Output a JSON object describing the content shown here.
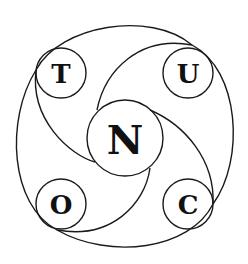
{
  "diagram": {
    "title": "",
    "nodes": [
      {
        "id": "center",
        "label": "N",
        "cx": 125,
        "cy": 138,
        "r": 38,
        "font_size": 40
      },
      {
        "id": "top-left",
        "label": "T",
        "cx": 61,
        "cy": 73,
        "r": 25,
        "font_size": 26
      },
      {
        "id": "top-right",
        "label": "U",
        "cx": 188,
        "cy": 73,
        "r": 25,
        "font_size": 26
      },
      {
        "id": "bottom-left",
        "label": "O",
        "cx": 61,
        "cy": 204,
        "r": 25,
        "font_size": 26
      },
      {
        "id": "bottom-right",
        "label": "C",
        "cx": 188,
        "cy": 204,
        "r": 25,
        "font_size": 26
      }
    ],
    "colors": {
      "stroke": "#1a1a1a",
      "text": "#111111",
      "background": "#ffffff"
    }
  }
}
